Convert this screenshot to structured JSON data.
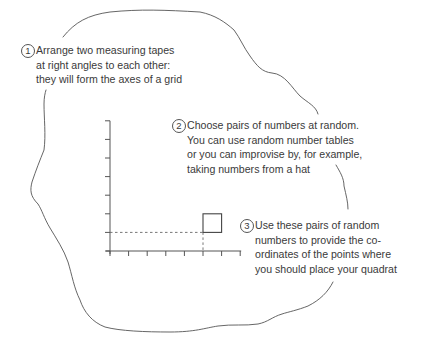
{
  "colors": {
    "text": "#3a3a3a",
    "line": "#555555",
    "background": "#ffffff"
  },
  "steps": [
    {
      "number": "1",
      "lines": [
        "Arrange two measuring tapes",
        "at right angles to each other:",
        "they will form the axes of a grid"
      ]
    },
    {
      "number": "2",
      "lines": [
        "Choose pairs of numbers at random.",
        "You can use random number tables",
        "or you can improvise by, for example,",
        "taking numbers from a hat"
      ]
    },
    {
      "number": "3",
      "lines": [
        "Use these pairs of random",
        "numbers to provide the co-",
        "ordinates of the points where",
        "you should place your quadrat"
      ]
    }
  ],
  "grid": {
    "x_ticks": 8,
    "y_ticks": 8,
    "quadrat_coordinate": {
      "x": 5,
      "y": 1
    },
    "quadrat_size_units": 1
  }
}
